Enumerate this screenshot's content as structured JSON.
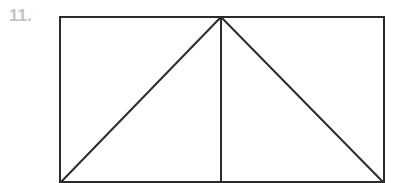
{
  "problem_number": "11.",
  "figure": {
    "stroke_color": "#2b2b2b",
    "label_color": "#c4c4c4"
  }
}
